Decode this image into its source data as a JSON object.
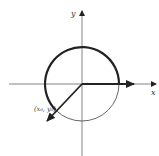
{
  "diagram": {
    "type": "unit-circle-vector",
    "axes": {
      "x_label": "x",
      "y_label": "y"
    },
    "point_label": "(x₀, y₀)",
    "colors": {
      "stroke": "#222222",
      "thin": "#555555",
      "background": "#ffffff"
    }
  }
}
